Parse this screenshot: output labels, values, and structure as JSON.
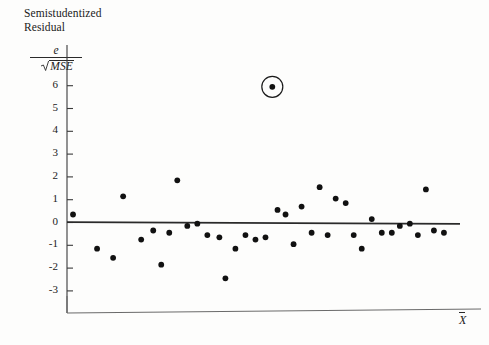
{
  "figure": {
    "y_axis_title_line1": "Semistudentized",
    "y_axis_title_line2": "Residual",
    "fraction_numerator": "e",
    "fraction_denominator": "MSE",
    "x_axis_label": "X"
  },
  "chart_data": {
    "type": "scatter",
    "title": "Semistudentized Residual",
    "xlabel": "X",
    "ylabel": "e / sqrt(MSE)",
    "ylim": [
      -3.6,
      6.6
    ],
    "xlim": [
      0,
      100
    ],
    "grid": false,
    "legend": null,
    "ytick_labels": [
      "6",
      "5",
      "4",
      "3",
      "2",
      "1",
      "0",
      "-1",
      "-2",
      "-3"
    ],
    "ytick_values": [
      6,
      5,
      4,
      3,
      2,
      1,
      0,
      -1,
      -2,
      -3
    ],
    "xtick_labels": [],
    "reference_line": {
      "label": "zero residual line",
      "x_start": 0,
      "y_start": 0.02,
      "x_end": 98,
      "y_end": -0.06
    },
    "annotations": [
      {
        "type": "circle",
        "label": "outlier-highlight",
        "x": 51.2,
        "y": 5.95
      }
    ],
    "points": [
      {
        "x": 1.5,
        "y": 0.35
      },
      {
        "x": 7.5,
        "y": -1.15
      },
      {
        "x": 11.5,
        "y": -1.55
      },
      {
        "x": 14.0,
        "y": 1.15
      },
      {
        "x": 18.5,
        "y": -0.75
      },
      {
        "x": 21.5,
        "y": -0.35
      },
      {
        "x": 23.5,
        "y": -1.85
      },
      {
        "x": 25.5,
        "y": -0.45
      },
      {
        "x": 27.5,
        "y": 1.85
      },
      {
        "x": 30.0,
        "y": -0.15
      },
      {
        "x": 32.5,
        "y": -0.05
      },
      {
        "x": 35.0,
        "y": -0.55
      },
      {
        "x": 38.0,
        "y": -0.65
      },
      {
        "x": 39.5,
        "y": -2.45
      },
      {
        "x": 42.0,
        "y": -1.15
      },
      {
        "x": 44.5,
        "y": -0.55
      },
      {
        "x": 47.0,
        "y": -0.75
      },
      {
        "x": 49.5,
        "y": -0.65
      },
      {
        "x": 52.5,
        "y": 0.55
      },
      {
        "x": 54.5,
        "y": 0.35
      },
      {
        "x": 56.5,
        "y": -0.95
      },
      {
        "x": 58.5,
        "y": 0.7
      },
      {
        "x": 61.0,
        "y": -0.45
      },
      {
        "x": 63.0,
        "y": 1.55
      },
      {
        "x": 65.0,
        "y": -0.55
      },
      {
        "x": 67.0,
        "y": 1.05
      },
      {
        "x": 69.5,
        "y": 0.85
      },
      {
        "x": 71.5,
        "y": -0.55
      },
      {
        "x": 73.5,
        "y": -1.15
      },
      {
        "x": 76.0,
        "y": 0.15
      },
      {
        "x": 78.5,
        "y": -0.45
      },
      {
        "x": 81.0,
        "y": -0.45
      },
      {
        "x": 83.0,
        "y": -0.15
      },
      {
        "x": 85.5,
        "y": -0.05
      },
      {
        "x": 87.5,
        "y": -0.55
      },
      {
        "x": 89.5,
        "y": 1.45
      },
      {
        "x": 91.5,
        "y": -0.35
      },
      {
        "x": 94.0,
        "y": -0.45
      }
    ]
  }
}
